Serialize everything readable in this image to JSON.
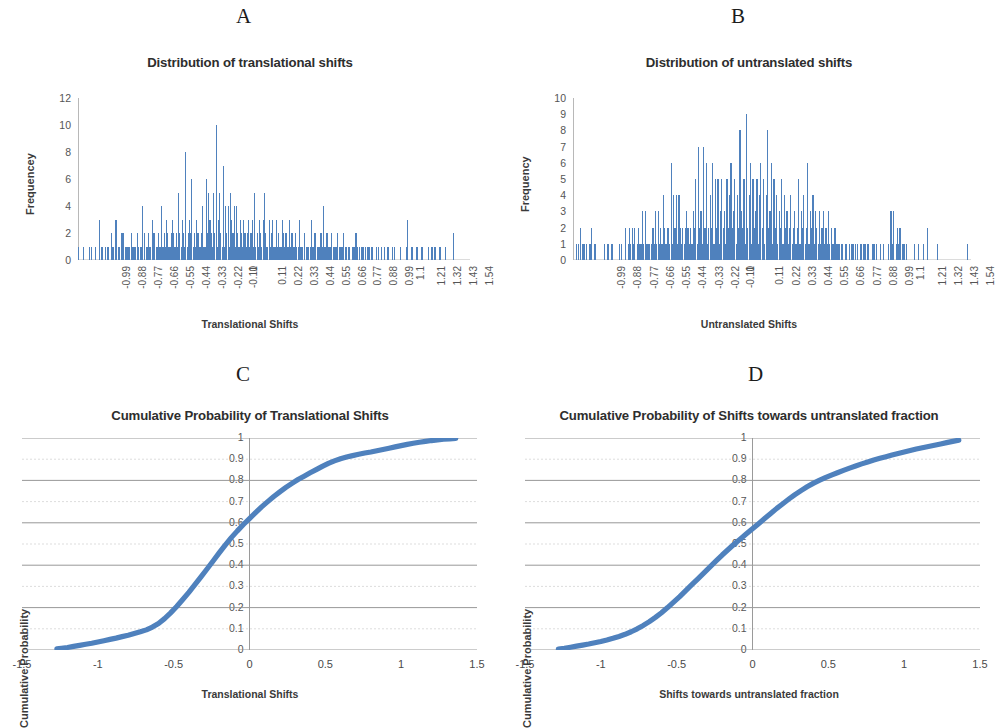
{
  "figure": {
    "background": "#ffffff",
    "series_color": "#4f81bd",
    "axis_color": "#b8b8b8",
    "grid_color": "#9a9a9a"
  },
  "panels": [
    {
      "letter": "A",
      "title": "Distribution of translational shifts",
      "xlabel": "Translational Shifts",
      "ylabel": "Frequencey"
    },
    {
      "letter": "B",
      "title": "Distribution of untranslated shifts",
      "xlabel": "Untranslated Shifts",
      "ylabel": "Frequency"
    },
    {
      "letter": "C",
      "title": "Cumulative Probability of Translational Shifts",
      "xlabel": "Translational Shifts",
      "ylabel": "Cumulative Probability"
    },
    {
      "letter": "D",
      "title": "Cumulative Probability of Shifts towards untranslated fraction",
      "xlabel": "Shifts towards untranslated fraction",
      "ylabel": "Cumulative Probability"
    }
  ],
  "chart_data": [
    {
      "type": "bar",
      "panel": "A",
      "title": "Distribution of translational shifts",
      "xlabel": "Translational Shifts",
      "ylabel": "Frequencey",
      "ylim": [
        0,
        12
      ],
      "yticks": [
        0,
        2,
        4,
        6,
        8,
        10,
        12
      ],
      "grid": false,
      "legend": "none",
      "xtick_labels": [
        "-0.99",
        "-0.88",
        "-0.77",
        "-0.66",
        "-0.55",
        "-0.44",
        "-0.33",
        "-0.22",
        "-0.11",
        "0",
        "0.11",
        "0.22",
        "0.33",
        "0.44",
        "0.55",
        "0.66",
        "0.77",
        "0.88",
        "0.99",
        "1.1",
        "1.21",
        "1.32",
        "1.43",
        "1.54"
      ],
      "xtick_step": 0.11,
      "xmin": -1.1,
      "xmax": 1.6,
      "bin_width": 0.011,
      "values": [
        1,
        0,
        0,
        0,
        1,
        0,
        0,
        0,
        0,
        1,
        0,
        1,
        0,
        0,
        1,
        0,
        0,
        3,
        0,
        1,
        1,
        0,
        1,
        0,
        1,
        1,
        0,
        2,
        1,
        1,
        0,
        3,
        0,
        1,
        1,
        0,
        2,
        2,
        0,
        1,
        1,
        1,
        1,
        0,
        2,
        1,
        1,
        1,
        0,
        2,
        1,
        1,
        1,
        4,
        0,
        2,
        1,
        1,
        2,
        1,
        1,
        3,
        2,
        2,
        0,
        1,
        2,
        1,
        1,
        4,
        1,
        2,
        1,
        3,
        2,
        1,
        1,
        2,
        3,
        2,
        1,
        2,
        1,
        5,
        2,
        1,
        3,
        2,
        1,
        8,
        1,
        2,
        3,
        2,
        6,
        1,
        2,
        1,
        3,
        2,
        1,
        1,
        2,
        4,
        1,
        1,
        6,
        2,
        5,
        3,
        2,
        1,
        5,
        2,
        10,
        1,
        3,
        5,
        2,
        1,
        7,
        1,
        4,
        2,
        4,
        1,
        5,
        3,
        2,
        4,
        1,
        4,
        2,
        1,
        3,
        2,
        1,
        3,
        2,
        1,
        2,
        3,
        1,
        2,
        3,
        1,
        5,
        1,
        2,
        1,
        3,
        2,
        1,
        3,
        5,
        2,
        1,
        1,
        3,
        1,
        2,
        3,
        1,
        1,
        3,
        1,
        2,
        1,
        1,
        3,
        2,
        1,
        2,
        1,
        1,
        3,
        1,
        2,
        1,
        1,
        2,
        1,
        1,
        3,
        1,
        1,
        1,
        2,
        0,
        1,
        1,
        1,
        1,
        3,
        1,
        1,
        2,
        0,
        1,
        1,
        1,
        2,
        1,
        4,
        1,
        1,
        2,
        1,
        1,
        1,
        2,
        1,
        1,
        1,
        1,
        2,
        1,
        1,
        1,
        1,
        2,
        1,
        1,
        0,
        1,
        1,
        0,
        1,
        1,
        1,
        2,
        1,
        0,
        1,
        0,
        1,
        1,
        0,
        1,
        0,
        1,
        1,
        0,
        1,
        1,
        0,
        0,
        1,
        0,
        1,
        0,
        1,
        0,
        0,
        1,
        0,
        1,
        1,
        0,
        0,
        1,
        0,
        1,
        0,
        0,
        0,
        0,
        1,
        0,
        0,
        0,
        0,
        1,
        3,
        0,
        0,
        1,
        1,
        0,
        0,
        1,
        1,
        0,
        0,
        1,
        1,
        0,
        0,
        0,
        0,
        1,
        0,
        0,
        1,
        0,
        1,
        1,
        0,
        0,
        1,
        1,
        0,
        0,
        0,
        1,
        0,
        0,
        0,
        0,
        0,
        0,
        2,
        0,
        0,
        0,
        0,
        0,
        0,
        0,
        0,
        0,
        0,
        0,
        0,
        0
      ]
    },
    {
      "type": "bar",
      "panel": "B",
      "title": "Distribution of untranslated shifts",
      "xlabel": "Untranslated Shifts",
      "ylabel": "Frequency",
      "ylim": [
        0,
        10
      ],
      "yticks": [
        0,
        1,
        2,
        3,
        4,
        5,
        6,
        7,
        8,
        9,
        10
      ],
      "grid": false,
      "legend": "none",
      "xtick_labels": [
        "-0.99",
        "-0.88",
        "-0.77",
        "-0.66",
        "-0.55",
        "-0.44",
        "-0.33",
        "-0.22",
        "-0.11",
        "0",
        "0.11",
        "0.22",
        "0.33",
        "0.44",
        "0.55",
        "0.66",
        "0.77",
        "0.88",
        "0.99",
        "1.1",
        "1.21",
        "1.32",
        "1.43",
        "1.54"
      ],
      "xtick_step": 0.11,
      "xmin": -1.1,
      "xmax": 1.6,
      "bin_width": 0.011,
      "values": [
        0,
        0,
        1,
        0,
        1,
        2,
        0,
        1,
        1,
        0,
        1,
        0,
        1,
        1,
        2,
        0,
        1,
        1,
        0,
        0,
        0,
        0,
        0,
        0,
        1,
        0,
        1,
        1,
        0,
        1,
        1,
        0,
        0,
        0,
        0,
        1,
        0,
        1,
        0,
        0,
        2,
        0,
        1,
        2,
        1,
        2,
        1,
        2,
        0,
        1,
        2,
        1,
        1,
        3,
        1,
        3,
        1,
        1,
        1,
        0,
        1,
        2,
        1,
        3,
        1,
        3,
        1,
        2,
        1,
        4,
        2,
        1,
        2,
        2,
        1,
        6,
        1,
        4,
        2,
        4,
        1,
        4,
        2,
        1,
        2,
        1,
        2,
        3,
        2,
        1,
        2,
        1,
        3,
        2,
        5,
        1,
        7,
        2,
        3,
        1,
        7,
        2,
        6,
        1,
        2,
        4,
        2,
        6,
        1,
        5,
        2,
        5,
        1,
        3,
        5,
        2,
        3,
        1,
        5,
        2,
        4,
        6,
        2,
        3,
        5,
        1,
        4,
        2,
        8,
        3,
        2,
        5,
        1,
        9,
        2,
        4,
        6,
        1,
        5,
        2,
        3,
        5,
        1,
        4,
        6,
        2,
        5,
        1,
        4,
        8,
        2,
        3,
        6,
        1,
        5,
        2,
        4,
        1,
        3,
        2,
        5,
        1,
        4,
        2,
        3,
        1,
        2,
        4,
        1,
        2,
        3,
        1,
        2,
        5,
        1,
        3,
        2,
        4,
        1,
        2,
        6,
        1,
        3,
        2,
        4,
        1,
        3,
        2,
        1,
        3,
        1,
        2,
        3,
        1,
        2,
        1,
        3,
        1,
        2,
        1,
        1,
        2,
        1,
        1,
        1,
        0,
        1,
        1,
        0,
        1,
        1,
        0,
        1,
        0,
        1,
        1,
        0,
        1,
        1,
        0,
        0,
        1,
        0,
        1,
        1,
        0,
        1,
        1,
        0,
        0,
        1,
        1,
        0,
        1,
        0,
        0,
        1,
        0,
        1,
        0,
        0,
        0,
        1,
        0,
        3,
        1,
        3,
        0,
        1,
        2,
        1,
        2,
        0,
        1,
        1,
        0,
        1,
        0,
        0,
        0,
        0,
        0,
        1,
        0,
        0,
        1,
        0,
        0,
        0,
        1,
        0,
        0,
        2,
        0,
        0,
        0,
        0,
        0,
        0,
        0,
        1,
        0,
        0,
        0,
        0,
        0,
        0,
        0,
        0,
        0,
        0,
        0,
        0,
        0,
        0,
        0,
        0,
        0,
        0,
        0,
        0,
        0,
        0,
        1,
        0,
        0
      ]
    },
    {
      "type": "line",
      "panel": "C",
      "title": "Cumulative Probability of Translational Shifts",
      "xlabel": "Translational Shifts",
      "ylabel": "Cumulative Probability",
      "xlim": [
        -1.5,
        1.5
      ],
      "ylim": [
        0,
        1
      ],
      "xticks": [
        -1.5,
        -1,
        -0.5,
        0,
        0.5,
        1,
        1.5
      ],
      "xtick_labels": [
        "-1.5",
        "-1",
        "-0.5",
        "0",
        "0.5",
        "1",
        "1.5"
      ],
      "yticks": [
        0,
        0.1,
        0.2,
        0.3,
        0.4,
        0.5,
        0.6,
        0.7,
        0.8,
        0.9,
        1
      ],
      "ytick_labels": [
        "0",
        "0.1",
        "0.2",
        "0.3",
        "0.4",
        "0.5",
        "0.6",
        "0.7",
        "0.8",
        "0.9",
        "1"
      ],
      "grid": true,
      "legend": "none",
      "x": [
        -1.27,
        -1.24,
        -1.2,
        -1.16,
        -1.12,
        -1.08,
        -1.04,
        -1.0,
        -0.96,
        -0.92,
        -0.88,
        -0.84,
        -0.8,
        -0.76,
        -0.72,
        -0.68,
        -0.64,
        -0.6,
        -0.56,
        -0.52,
        -0.48,
        -0.44,
        -0.4,
        -0.36,
        -0.32,
        -0.28,
        -0.24,
        -0.2,
        -0.16,
        -0.12,
        -0.08,
        -0.04,
        0.0,
        0.04,
        0.08,
        0.12,
        0.16,
        0.2,
        0.24,
        0.28,
        0.32,
        0.36,
        0.4,
        0.44,
        0.48,
        0.52,
        0.56,
        0.6,
        0.64,
        0.68,
        0.72,
        0.76,
        0.8,
        0.84,
        0.88,
        0.92,
        0.96,
        1.0,
        1.04,
        1.08,
        1.12,
        1.16,
        1.2,
        1.24,
        1.28,
        1.32,
        1.36
      ],
      "y": [
        0.005,
        0.008,
        0.012,
        0.017,
        0.022,
        0.027,
        0.032,
        0.038,
        0.044,
        0.05,
        0.056,
        0.063,
        0.07,
        0.078,
        0.086,
        0.095,
        0.108,
        0.125,
        0.148,
        0.175,
        0.205,
        0.238,
        0.272,
        0.308,
        0.345,
        0.382,
        0.42,
        0.458,
        0.495,
        0.53,
        0.562,
        0.592,
        0.62,
        0.648,
        0.675,
        0.7,
        0.724,
        0.746,
        0.767,
        0.786,
        0.804,
        0.82,
        0.836,
        0.851,
        0.866,
        0.88,
        0.892,
        0.902,
        0.91,
        0.917,
        0.923,
        0.929,
        0.934,
        0.94,
        0.946,
        0.952,
        0.958,
        0.964,
        0.97,
        0.975,
        0.98,
        0.984,
        0.988,
        0.991,
        0.994,
        0.996,
        0.998
      ]
    },
    {
      "type": "line",
      "panel": "D",
      "title": "Cumulative Probability of Shifts towards untranslated fraction",
      "xlabel": "Shifts towards untranslated fraction",
      "ylabel": "Cumulative Probability",
      "xlim": [
        -1.5,
        1.5
      ],
      "ylim": [
        0,
        1
      ],
      "xticks": [
        -1.5,
        -1,
        -0.5,
        0,
        0.5,
        1,
        1.5
      ],
      "xtick_labels": [
        "-1.5",
        "-1",
        "-0.5",
        "0",
        "0.5",
        "1",
        "1.5"
      ],
      "yticks": [
        0,
        0.1,
        0.2,
        0.3,
        0.4,
        0.5,
        0.6,
        0.7,
        0.8,
        0.9,
        1
      ],
      "ytick_labels": [
        "0",
        "0.1",
        "0.2",
        "0.3",
        "0.4",
        "0.5",
        "0.6",
        "0.7",
        "0.8",
        "0.9",
        "1"
      ],
      "grid": true,
      "legend": "none",
      "x": [
        -1.28,
        -1.24,
        -1.2,
        -1.16,
        -1.12,
        -1.08,
        -1.04,
        -1.0,
        -0.96,
        -0.92,
        -0.88,
        -0.84,
        -0.8,
        -0.76,
        -0.72,
        -0.68,
        -0.64,
        -0.6,
        -0.56,
        -0.52,
        -0.48,
        -0.44,
        -0.4,
        -0.36,
        -0.32,
        -0.28,
        -0.24,
        -0.2,
        -0.16,
        -0.12,
        -0.08,
        -0.04,
        0.0,
        0.04,
        0.08,
        0.12,
        0.16,
        0.2,
        0.24,
        0.28,
        0.32,
        0.36,
        0.4,
        0.44,
        0.48,
        0.52,
        0.56,
        0.6,
        0.64,
        0.68,
        0.72,
        0.76,
        0.8,
        0.84,
        0.88,
        0.92,
        0.96,
        1.0,
        1.04,
        1.08,
        1.12,
        1.16,
        1.2,
        1.24,
        1.28,
        1.32,
        1.36
      ],
      "y": [
        0.004,
        0.008,
        0.013,
        0.018,
        0.023,
        0.028,
        0.034,
        0.04,
        0.047,
        0.055,
        0.064,
        0.074,
        0.086,
        0.1,
        0.116,
        0.134,
        0.154,
        0.176,
        0.2,
        0.226,
        0.252,
        0.28,
        0.308,
        0.336,
        0.364,
        0.392,
        0.42,
        0.448,
        0.474,
        0.5,
        0.524,
        0.548,
        0.572,
        0.596,
        0.62,
        0.644,
        0.668,
        0.69,
        0.712,
        0.733,
        0.752,
        0.77,
        0.786,
        0.8,
        0.813,
        0.825,
        0.836,
        0.847,
        0.858,
        0.868,
        0.878,
        0.887,
        0.896,
        0.904,
        0.912,
        0.92,
        0.927,
        0.934,
        0.941,
        0.948,
        0.954,
        0.96,
        0.966,
        0.972,
        0.978,
        0.984,
        0.99
      ]
    }
  ]
}
